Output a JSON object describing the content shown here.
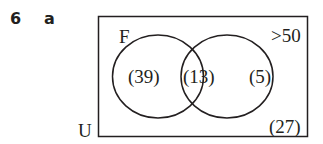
{
  "question": {
    "number": "6",
    "part": "a"
  },
  "venn": {
    "universe_label": "U",
    "set_a_label": "F",
    "set_b_label": ">50",
    "only_a": "(39)",
    "both": "(13)",
    "only_b": "(5)",
    "neither": "(27)"
  }
}
